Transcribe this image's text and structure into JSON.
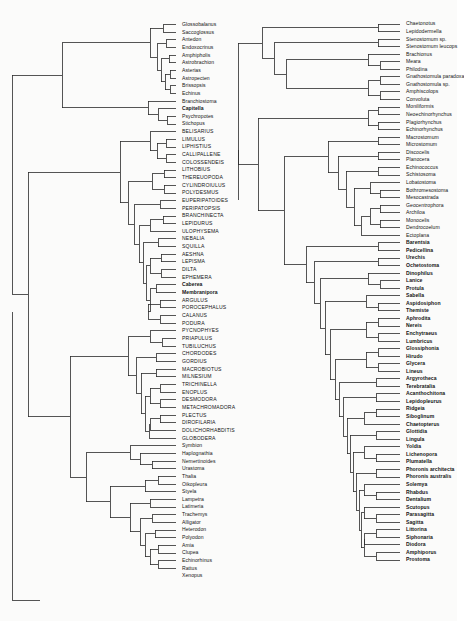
{
  "figure": {
    "type": "phylogenetic-cladogram",
    "panels": 2
  },
  "left_panel": {
    "name": "left-cladogram",
    "taxa": [
      {
        "label": "Glossobalanus",
        "style": "italic-normal"
      },
      {
        "label": "Saccoglossus",
        "style": "normal"
      },
      {
        "label": "Antedon",
        "style": "normal"
      },
      {
        "label": "Endoxocrinus",
        "style": "normal"
      },
      {
        "label": "Amphipholis",
        "style": "normal"
      },
      {
        "label": "Astrobrachion",
        "style": "normal"
      },
      {
        "label": "Asterias",
        "style": "normal"
      },
      {
        "label": "Astropecten",
        "style": "normal"
      },
      {
        "label": "Brissopsis",
        "style": "normal"
      },
      {
        "label": "Echinus",
        "style": "normal"
      },
      {
        "label": "Branchiostoma",
        "style": "normal"
      },
      {
        "label": "Capitella",
        "style": "bold"
      },
      {
        "label": "Psychropotes",
        "style": "normal"
      },
      {
        "label": "Stichopus",
        "style": "normal"
      },
      {
        "label": "BELISARIUS",
        "style": "caps"
      },
      {
        "label": "LIMULUS",
        "style": "caps"
      },
      {
        "label": "LIPHISTIUS",
        "style": "caps"
      },
      {
        "label": "CALLIPALLENE",
        "style": "caps"
      },
      {
        "label": "COLOSSENDEIS",
        "style": "caps"
      },
      {
        "label": "LITHOBIUS",
        "style": "caps"
      },
      {
        "label": "THEREUOPODA",
        "style": "caps"
      },
      {
        "label": "CYLINDROIULUS",
        "style": "caps"
      },
      {
        "label": "POLYDESMUS",
        "style": "caps"
      },
      {
        "label": "EUPERIPATOIDES",
        "style": "caps"
      },
      {
        "label": "PERIPATOPSIS",
        "style": "caps"
      },
      {
        "label": "BRANCHINECTA",
        "style": "caps"
      },
      {
        "label": "LEPIDURUS",
        "style": "caps"
      },
      {
        "label": "ULOPHYSEMA",
        "style": "caps"
      },
      {
        "label": "NEBALIA",
        "style": "caps"
      },
      {
        "label": "SQUILLA",
        "style": "caps"
      },
      {
        "label": "AESHNA",
        "style": "caps"
      },
      {
        "label": "LEPISMA",
        "style": "caps"
      },
      {
        "label": "DILTA",
        "style": "caps"
      },
      {
        "label": "EPHEMERA",
        "style": "caps"
      },
      {
        "label": "Caberea",
        "style": "bold"
      },
      {
        "label": "Membranipora",
        "style": "bold"
      },
      {
        "label": "ARGULUS",
        "style": "caps"
      },
      {
        "label": "POROCEPHALUS",
        "style": "caps"
      },
      {
        "label": "CALANUS",
        "style": "caps"
      },
      {
        "label": "PODURA",
        "style": "caps"
      },
      {
        "label": "PYCNOPHYES",
        "style": "caps"
      },
      {
        "label": "PRIAPULUS",
        "style": "caps"
      },
      {
        "label": "TUBILUCHUS",
        "style": "caps"
      },
      {
        "label": "CHORDODES",
        "style": "caps"
      },
      {
        "label": "GORDIUS",
        "style": "caps"
      },
      {
        "label": "MACROBIOTUS",
        "style": "caps"
      },
      {
        "label": "MILNESIUM",
        "style": "caps"
      },
      {
        "label": "TRICHINELLA",
        "style": "caps"
      },
      {
        "label": "ENOPLUS",
        "style": "caps"
      },
      {
        "label": "DESMODORA",
        "style": "caps"
      },
      {
        "label": "METACHROMADORA",
        "style": "caps"
      },
      {
        "label": "PLECTUS",
        "style": "caps"
      },
      {
        "label": "DIROFILARIA",
        "style": "caps"
      },
      {
        "label": "DOLICHORHABDITIS",
        "style": "caps"
      },
      {
        "label": "GLOBODERA",
        "style": "caps"
      },
      {
        "label": "Symbion",
        "style": "normal"
      },
      {
        "label": "Haplognathia",
        "style": "normal"
      },
      {
        "label": "Nemertinoides",
        "style": "normal"
      },
      {
        "label": "Urastoma",
        "style": "normal"
      },
      {
        "label": "Thalia",
        "style": "normal"
      },
      {
        "label": "Oikopleura",
        "style": "normal"
      },
      {
        "label": "Styela",
        "style": "normal"
      },
      {
        "label": "Lampetra",
        "style": "normal"
      },
      {
        "label": "Latimeria",
        "style": "normal"
      },
      {
        "label": "Trachemys",
        "style": "normal"
      },
      {
        "label": "Alligator",
        "style": "normal"
      },
      {
        "label": "Heterodon",
        "style": "normal"
      },
      {
        "label": "Polyodon",
        "style": "normal"
      },
      {
        "label": "Amia",
        "style": "normal"
      },
      {
        "label": "Clupea",
        "style": "normal"
      },
      {
        "label": "Echinorhinus",
        "style": "normal"
      },
      {
        "label": "Rattus",
        "style": "normal"
      },
      {
        "label": "Xenopus",
        "style": "normal"
      }
    ]
  },
  "right_panel": {
    "name": "right-cladogram",
    "taxa": [
      {
        "label": "Chaetonotus",
        "style": "normal"
      },
      {
        "label": "Lepidodermella",
        "style": "normal"
      },
      {
        "label": "Stenostomum sp.",
        "style": "normal"
      },
      {
        "label": "Stenostomum leucops",
        "style": "normal"
      },
      {
        "label": "Brachionus",
        "style": "normal"
      },
      {
        "label": "Meara",
        "style": "normal"
      },
      {
        "label": "Philodina",
        "style": "normal"
      },
      {
        "label": "Gnathostomula paradoxa",
        "style": "normal"
      },
      {
        "label": "Gnathostomula sp.",
        "style": "normal"
      },
      {
        "label": "Amphiscolops",
        "style": "normal"
      },
      {
        "label": "Convoluta",
        "style": "normal"
      },
      {
        "label": "Moniliformis",
        "style": "normal"
      },
      {
        "label": "Neoechinorhynchus",
        "style": "normal"
      },
      {
        "label": "Plagiorhynchus",
        "style": "normal"
      },
      {
        "label": "Echinorhynchus",
        "style": "normal"
      },
      {
        "label": "Macrostomum",
        "style": "normal"
      },
      {
        "label": "Microstomum",
        "style": "normal"
      },
      {
        "label": "Discocelis",
        "style": "normal"
      },
      {
        "label": "Planocera",
        "style": "normal"
      },
      {
        "label": "Echinococcus",
        "style": "normal"
      },
      {
        "label": "Schistosoma",
        "style": "normal"
      },
      {
        "label": "Lobatostoma",
        "style": "normal"
      },
      {
        "label": "Bothromesostoma",
        "style": "normal"
      },
      {
        "label": "Mesocastrada",
        "style": "normal"
      },
      {
        "label": "Geocentrophora",
        "style": "normal"
      },
      {
        "label": "Archiloa",
        "style": "normal"
      },
      {
        "label": "Monocelis",
        "style": "normal"
      },
      {
        "label": "Dendrocoelum",
        "style": "normal"
      },
      {
        "label": "Ectoplana",
        "style": "normal"
      },
      {
        "label": "Barentsia",
        "style": "bold"
      },
      {
        "label": "Pedicellina",
        "style": "bold"
      },
      {
        "label": "Urechis",
        "style": "bold"
      },
      {
        "label": "Ochetostoma",
        "style": "bold"
      },
      {
        "label": "Dinophilus",
        "style": "bold"
      },
      {
        "label": "Lanice",
        "style": "bold"
      },
      {
        "label": "Protula",
        "style": "bold"
      },
      {
        "label": "Sabella",
        "style": "bold"
      },
      {
        "label": "Aspidosiphon",
        "style": "bold"
      },
      {
        "label": "Themiste",
        "style": "bold"
      },
      {
        "label": "Aphrodita",
        "style": "bold"
      },
      {
        "label": "Nereis",
        "style": "bold"
      },
      {
        "label": "Enchytraeus",
        "style": "bold"
      },
      {
        "label": "Lumbricus",
        "style": "bold"
      },
      {
        "label": "Glossiphonia",
        "style": "bold"
      },
      {
        "label": "Hirudo",
        "style": "bold"
      },
      {
        "label": "Glycera",
        "style": "bold"
      },
      {
        "label": "Lineus",
        "style": "bold"
      },
      {
        "label": "Argyrotheca",
        "style": "bold"
      },
      {
        "label": "Terebratalia",
        "style": "bold"
      },
      {
        "label": "Acanthochitona",
        "style": "bold"
      },
      {
        "label": "Lepidopleurus",
        "style": "bold"
      },
      {
        "label": "Ridgeia",
        "style": "bold"
      },
      {
        "label": "Siboglinum",
        "style": "bold"
      },
      {
        "label": "Chaetopterus",
        "style": "bold"
      },
      {
        "label": "Glottidia",
        "style": "bold"
      },
      {
        "label": "Lingula",
        "style": "bold"
      },
      {
        "label": "Yoldia",
        "style": "bold"
      },
      {
        "label": "Lichenopora",
        "style": "bold"
      },
      {
        "label": "Plumatella",
        "style": "bold"
      },
      {
        "label": "Phoronis architecta",
        "style": "bold"
      },
      {
        "label": "Phoronis australis",
        "style": "bold"
      },
      {
        "label": "Solemya",
        "style": "bold"
      },
      {
        "label": "Rhabdus",
        "style": "bold"
      },
      {
        "label": "Dentalium",
        "style": "bold"
      },
      {
        "label": "Scutopus",
        "style": "bold"
      },
      {
        "label": "Parasagitta",
        "style": "bold"
      },
      {
        "label": "Sagitta",
        "style": "bold"
      },
      {
        "label": "Littorina",
        "style": "bold"
      },
      {
        "label": "Siphonaria",
        "style": "bold"
      },
      {
        "label": "Diodora",
        "style": "bold"
      },
      {
        "label": "Amphiporus",
        "style": "bold"
      },
      {
        "label": "Prostoma",
        "style": "bold"
      }
    ]
  },
  "colors": {
    "background": "#fbfbfa",
    "lines": "#2b2b2b",
    "text": "#141414"
  }
}
